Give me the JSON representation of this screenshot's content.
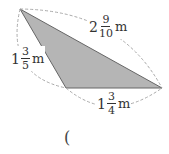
{
  "diagram": {
    "shape": "triangle",
    "fill_color": "#b5b5b5",
    "edge_color": "#666666",
    "dash_color": "#aaaaaa",
    "vertices": {
      "top": [
        20,
        9
      ],
      "right": [
        162,
        88
      ],
      "bottom": [
        66,
        88
      ]
    },
    "sides": [
      {
        "id": "top-right",
        "whole": "2",
        "numerator": "9",
        "denominator": "10",
        "unit": "m"
      },
      {
        "id": "top-bottom",
        "whole": "1",
        "numerator": "3",
        "denominator": "5",
        "unit": "m"
      },
      {
        "id": "bottom-right",
        "whole": "1",
        "numerator": "3",
        "denominator": "4",
        "unit": "m"
      }
    ]
  },
  "answer": {
    "open_paren": "("
  }
}
